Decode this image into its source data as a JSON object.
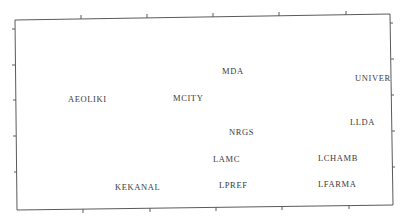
{
  "chart_data": {
    "type": "scatter",
    "title": "",
    "xlabel": "",
    "ylabel": "",
    "grid": false,
    "legend": null,
    "axis_tick_labels": {
      "x": [],
      "y": []
    },
    "xlim": [
      0,
      1
    ],
    "ylim": [
      0,
      1
    ],
    "points": [
      {
        "label": "AEOLIKI",
        "x": 0.15,
        "y": 0.58
      },
      {
        "label": "MCITY",
        "x": 0.43,
        "y": 0.58
      },
      {
        "label": "MDA",
        "x": 0.57,
        "y": 0.73
      },
      {
        "label": "UNIVER",
        "x": 0.91,
        "y": 0.68
      },
      {
        "label": "LLDA",
        "x": 0.9,
        "y": 0.44
      },
      {
        "label": "NRGS",
        "x": 0.59,
        "y": 0.39
      },
      {
        "label": "LAMC",
        "x": 0.55,
        "y": 0.25
      },
      {
        "label": "LCHAMB",
        "x": 0.82,
        "y": 0.25
      },
      {
        "label": "LPREF",
        "x": 0.57,
        "y": 0.11
      },
      {
        "label": "LFARMA",
        "x": 0.82,
        "y": 0.11
      },
      {
        "label": "KEKANAL",
        "x": 0.3,
        "y": 0.1
      }
    ]
  },
  "render": {
    "frame": {
      "top_left": [
        15,
        20
      ],
      "top_right": [
        390,
        14
      ],
      "bottom_right": [
        393,
        205
      ],
      "bottom_left": [
        17,
        210
      ]
    },
    "ticks": {
      "top": [
        [
          81,
          19
        ],
        [
          147,
          18
        ],
        [
          213,
          17
        ],
        [
          279,
          16
        ],
        [
          346,
          15
        ]
      ],
      "bottom": [
        [
          83,
          209
        ],
        [
          150,
          208
        ],
        [
          216,
          207
        ],
        [
          282,
          206
        ],
        [
          349,
          205
        ]
      ],
      "left": [
        [
          15,
          29
        ],
        [
          15,
          65
        ],
        [
          16,
          100
        ],
        [
          16,
          136
        ],
        [
          17,
          172
        ]
      ],
      "right": [
        [
          390,
          23
        ],
        [
          391,
          59
        ],
        [
          391,
          95
        ],
        [
          392,
          131
        ],
        [
          392,
          167
        ]
      ]
    },
    "label_positions": [
      {
        "label": "AEOLIKI",
        "x": 68,
        "y": 102
      },
      {
        "label": "MCITY",
        "x": 173,
        "y": 101
      },
      {
        "label": "MDA",
        "x": 222,
        "y": 74
      },
      {
        "label": "UNIVER",
        "x": 355,
        "y": 81
      },
      {
        "label": "LLDA",
        "x": 350,
        "y": 125
      },
      {
        "label": "NRGS",
        "x": 229,
        "y": 135
      },
      {
        "label": "LAMC",
        "x": 213,
        "y": 162
      },
      {
        "label": "LCHAMB",
        "x": 318,
        "y": 161
      },
      {
        "label": "LPREF",
        "x": 219,
        "y": 188
      },
      {
        "label": "LFARMA",
        "x": 318,
        "y": 187
      },
      {
        "label": "KEKANAL",
        "x": 115,
        "y": 190
      }
    ],
    "colors": {
      "frame": "#5a5a5a",
      "text": "#3a3a3a",
      "background": "#ffffff"
    }
  }
}
